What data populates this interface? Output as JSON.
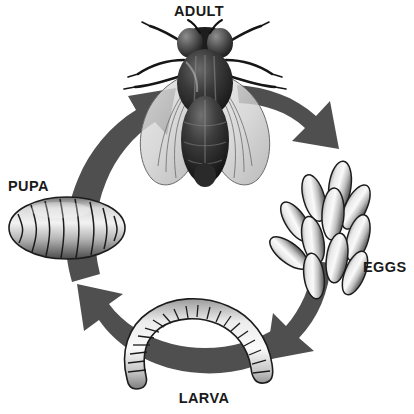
{
  "diagram": {
    "type": "cycle-diagram",
    "background_color": "#ffffff",
    "arrow_color": "#4f4f4f",
    "label_color": "#1a1a1a",
    "stages": [
      {
        "id": "adult",
        "label": "ADULT",
        "label_x": 199,
        "label_y": 16,
        "anchor": "middle",
        "figure": "housefly-illustration",
        "center_x": 205,
        "center_y": 108
      },
      {
        "id": "eggs",
        "label": "EGGS",
        "label_x": 363,
        "label_y": 272,
        "anchor": "start",
        "figure": "egg-cluster-illustration",
        "center_x": 333,
        "center_y": 222
      },
      {
        "id": "larva",
        "label": "LARVA",
        "label_x": 204,
        "label_y": 403,
        "anchor": "middle",
        "figure": "larva-maggot-illustration",
        "center_x": 202,
        "center_y": 340
      },
      {
        "id": "pupa",
        "label": "PUPA",
        "label_x": 8,
        "label_y": 191,
        "anchor": "start",
        "figure": "pupa-capsule-illustration",
        "center_x": 67,
        "center_y": 228
      }
    ],
    "arrows": [
      {
        "id": "arrow-adult-to-eggs",
        "from": "adult",
        "to": "eggs",
        "direction": "down-right",
        "quadrant": "top-right"
      },
      {
        "id": "arrow-eggs-to-larva",
        "from": "eggs",
        "to": "larva",
        "direction": "down-left",
        "quadrant": "bottom-right"
      },
      {
        "id": "arrow-larva-to-pupa",
        "from": "larva",
        "to": "pupa",
        "direction": "up-left",
        "quadrant": "bottom-left"
      },
      {
        "id": "arrow-pupa-to-adult",
        "from": "pupa",
        "to": "adult",
        "direction": "up-right",
        "quadrant": "top-left"
      }
    ]
  }
}
